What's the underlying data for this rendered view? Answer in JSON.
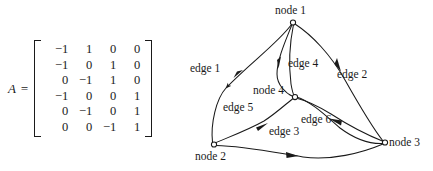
{
  "figure": {
    "matrix": {
      "name": "A",
      "label": "A =",
      "rows": [
        [
          "−1",
          "1",
          "0",
          "0"
        ],
        [
          "−1",
          "0",
          "1",
          "0"
        ],
        [
          "0",
          "−1",
          "1",
          "0"
        ],
        [
          "−1",
          "0",
          "0",
          "1"
        ],
        [
          "0",
          "−1",
          "0",
          "1"
        ],
        [
          "0",
          "0",
          "−1",
          "1"
        ]
      ]
    },
    "graph": {
      "nodes": [
        {
          "id": "node1",
          "label": "node 1",
          "x": 293,
          "y": 22
        },
        {
          "id": "node2",
          "label": "node 2",
          "x": 214,
          "y": 145
        },
        {
          "id": "node3",
          "label": "node 3",
          "x": 385,
          "y": 143
        },
        {
          "id": "node4",
          "label": "node 4",
          "x": 295,
          "y": 97
        }
      ],
      "edges": [
        {
          "id": "edge1",
          "label": "edge 1",
          "from": "node1",
          "to": "node2"
        },
        {
          "id": "edge2",
          "label": "edge 2",
          "from": "node1",
          "to": "node3"
        },
        {
          "id": "edge3",
          "label": "edge 3",
          "from": "node2",
          "to": "node3"
        },
        {
          "id": "edge4",
          "label": "edge 4",
          "from": "node1",
          "to": "node4"
        },
        {
          "id": "edge5",
          "label": "edge 5",
          "from": "node2",
          "to": "node4"
        },
        {
          "id": "edge6",
          "label": "edge 6",
          "from": "node3",
          "to": "node4"
        }
      ]
    },
    "colors": {
      "background": "#ffffff",
      "ink": "#1a1a1a"
    }
  }
}
